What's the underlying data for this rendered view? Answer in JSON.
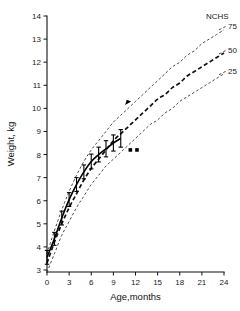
{
  "chart_data": {
    "type": "line",
    "title": "",
    "xlabel": "Age,months",
    "ylabel": "Weight, kg",
    "xlim": [
      0,
      24
    ],
    "ylim": [
      2.5,
      14
    ],
    "grid": false,
    "legend_position": "right-inline",
    "x_ticks": [
      0,
      3,
      6,
      9,
      12,
      15,
      18,
      21,
      24
    ],
    "y_ticks": [
      3,
      4,
      5,
      6,
      7,
      8,
      9,
      10,
      11,
      12,
      13,
      14
    ],
    "legend_heading": "NCHS",
    "annotations": [
      {
        "name": "arrow-marker-on-p50",
        "x": 11.0,
        "y": 10.25
      },
      {
        "name": "square-marker-1",
        "x": 11.3,
        "y": 8.2
      },
      {
        "name": "square-marker-2",
        "x": 12.2,
        "y": 8.2
      }
    ],
    "series": [
      {
        "name": "75",
        "label": "75",
        "style": "dashed-thin",
        "x": [
          0,
          1,
          2,
          3,
          4,
          5,
          6,
          7,
          8,
          9,
          10,
          11,
          12,
          13,
          14,
          15,
          16,
          17,
          18,
          19,
          20,
          21,
          22,
          23,
          24
        ],
        "values": [
          3.7,
          4.7,
          5.6,
          6.4,
          7.1,
          7.7,
          8.2,
          8.6,
          9.0,
          9.4,
          9.7,
          10.0,
          10.3,
          10.6,
          10.9,
          11.2,
          11.5,
          11.8,
          12.0,
          12.3,
          12.5,
          12.8,
          13.0,
          13.2,
          13.4
        ]
      },
      {
        "name": "50",
        "label": "50",
        "style": "dashed-bold",
        "x": [
          0,
          1,
          2,
          3,
          4,
          5,
          6,
          7,
          8,
          9,
          10,
          11,
          12,
          13,
          14,
          15,
          16,
          17,
          18,
          19,
          20,
          21,
          22,
          23,
          24
        ],
        "values": [
          3.3,
          4.2,
          5.0,
          5.7,
          6.3,
          6.9,
          7.4,
          7.8,
          8.2,
          8.6,
          8.9,
          9.2,
          9.5,
          9.8,
          10.1,
          10.4,
          10.6,
          10.9,
          11.1,
          11.4,
          11.6,
          11.8,
          12.0,
          12.2,
          12.4
        ]
      },
      {
        "name": "25",
        "label": "25",
        "style": "dashed-thin",
        "x": [
          0,
          1,
          2,
          3,
          4,
          5,
          6,
          7,
          8,
          9,
          10,
          11,
          12,
          13,
          14,
          15,
          16,
          17,
          18,
          19,
          20,
          21,
          22,
          23,
          24
        ],
        "values": [
          2.9,
          3.7,
          4.5,
          5.1,
          5.7,
          6.2,
          6.7,
          7.1,
          7.5,
          7.8,
          8.1,
          8.4,
          8.7,
          9.0,
          9.3,
          9.5,
          9.8,
          10.0,
          10.3,
          10.5,
          10.7,
          10.9,
          11.1,
          11.3,
          11.5
        ]
      },
      {
        "name": "study",
        "label": "",
        "style": "solid-with-errorbars",
        "x": [
          0,
          1,
          2,
          3,
          4,
          5,
          6,
          7,
          8,
          9,
          10
        ],
        "values": [
          3.55,
          4.35,
          5.25,
          6.05,
          6.7,
          7.25,
          7.7,
          8.0,
          8.25,
          8.5,
          8.7
        ],
        "errors": [
          0.3,
          0.28,
          0.3,
          0.3,
          0.3,
          0.3,
          0.32,
          0.32,
          0.35,
          0.35,
          0.38
        ]
      }
    ]
  },
  "labels": {
    "x_axis_title": "Age,months",
    "y_axis_title": "Weight, kg",
    "legend_heading": "NCHS",
    "curve_75": "75",
    "curve_50": "50",
    "curve_25": "25",
    "tick_x_0": "0",
    "tick_x_1": "3",
    "tick_x_2": "6",
    "tick_x_3": "9",
    "tick_x_4": "12",
    "tick_x_5": "15",
    "tick_x_6": "18",
    "tick_x_7": "21",
    "tick_x_8": "24",
    "tick_y_3": "3",
    "tick_y_4": "4",
    "tick_y_5": "5",
    "tick_y_6": "6",
    "tick_y_7": "7",
    "tick_y_8": "8",
    "tick_y_9": "9",
    "tick_y_10": "10",
    "tick_y_11": "11",
    "tick_y_12": "12",
    "tick_y_13": "13",
    "tick_y_14": "14"
  },
  "colors": {
    "axis": "#111111",
    "data_line": "#000000",
    "percentile_curve": "#2b2b2b",
    "background": "#ffffff"
  }
}
